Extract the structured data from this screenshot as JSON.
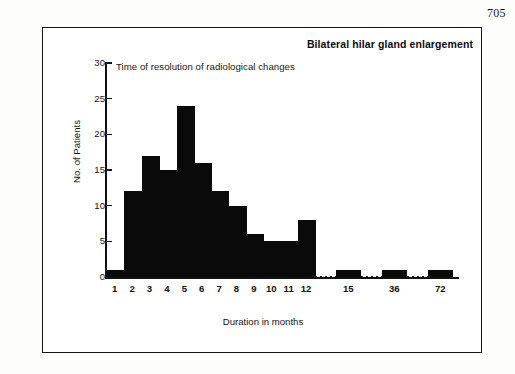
{
  "page": {
    "page_number": "705"
  },
  "chart_data": {
    "type": "bar",
    "title": "Bilateral hilar gland enlargement",
    "subtitle": "Time of resolution of radiological changes",
    "xlabel": "Duration in months",
    "ylabel": "No. of Patients",
    "ylim": [
      0,
      30
    ],
    "yticks": [
      0,
      5,
      10,
      15,
      20,
      25,
      30
    ],
    "ytick_labels": [
      "0",
      "5",
      "10",
      "15",
      "20",
      "25",
      "30"
    ],
    "grid": false,
    "legend": null,
    "categories": [
      "1",
      "2",
      "3",
      "4",
      "5",
      "6",
      "7",
      "8",
      "9",
      "10",
      "11",
      "12",
      "15",
      "36",
      "72"
    ],
    "values": [
      1,
      12,
      17,
      15,
      24,
      16,
      12,
      10,
      6,
      5,
      5,
      8,
      1,
      1,
      1
    ],
    "bins": [
      {
        "label": "1",
        "bin_start": 0,
        "bin_end": 1,
        "value": 1
      },
      {
        "label": "2",
        "bin_start": 1,
        "bin_end": 2,
        "value": 12
      },
      {
        "label": "3",
        "bin_start": 2,
        "bin_end": 3,
        "value": 17
      },
      {
        "label": "4",
        "bin_start": 3,
        "bin_end": 4,
        "value": 15
      },
      {
        "label": "5",
        "bin_start": 4,
        "bin_end": 5,
        "value": 24
      },
      {
        "label": "6",
        "bin_start": 5,
        "bin_end": 6,
        "value": 16
      },
      {
        "label": "7",
        "bin_start": 6,
        "bin_end": 7,
        "value": 12
      },
      {
        "label": "8",
        "bin_start": 7,
        "bin_end": 8,
        "value": 10
      },
      {
        "label": "9",
        "bin_start": 8,
        "bin_end": 9,
        "value": 6
      },
      {
        "label": "10",
        "bin_start": 9,
        "bin_end": 10,
        "value": 5
      },
      {
        "label": "11",
        "bin_start": 10,
        "bin_end": 11,
        "value": 5
      },
      {
        "label": "12",
        "bin_start": 11,
        "bin_end": 12,
        "value": 8
      }
    ],
    "tail_bins": [
      {
        "label": "15",
        "value": 1
      },
      {
        "label": "36",
        "value": 1
      },
      {
        "label": "72",
        "value": 1
      }
    ],
    "axis_break": true,
    "colors": {
      "bar": "#0a0a0a",
      "axis": "#111111",
      "text": "#141414",
      "background": "#ffffff"
    }
  }
}
